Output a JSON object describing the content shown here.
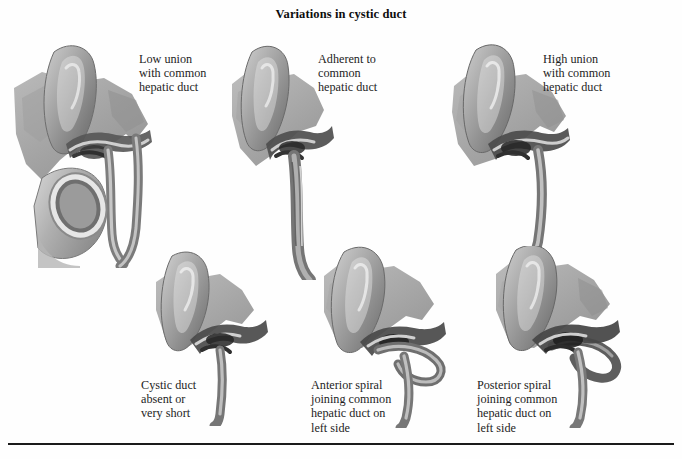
{
  "plate": {
    "title": "Variations in cystic duct",
    "background_color": "#fefefe",
    "text_color": "#1d1d1d",
    "rule_color": "#1a1a1a",
    "width": 682,
    "height": 459
  },
  "figures": [
    {
      "id": "low-union",
      "caption": "Low union\nwith common\nhepatic duct",
      "row": "top",
      "column": 1,
      "structures": [
        "liver",
        "gallbladder",
        "cystic duct",
        "common hepatic duct",
        "common bile duct",
        "duodenum"
      ]
    },
    {
      "id": "adherent-to-common-hepatic-duct",
      "caption": "Adherent to\ncommon\nhepatic duct",
      "row": "top",
      "column": 2,
      "structures": [
        "liver",
        "gallbladder",
        "cystic duct",
        "common hepatic duct",
        "common bile duct"
      ]
    },
    {
      "id": "high-union",
      "caption": "High union\nwith common\nhepatic duct",
      "row": "top",
      "column": 3,
      "structures": [
        "liver",
        "gallbladder",
        "cystic duct",
        "common hepatic duct",
        "common bile duct"
      ]
    },
    {
      "id": "cystic-duct-absent",
      "caption": "Cystic duct\nabsent or\nvery short",
      "row": "bottom",
      "column": 1,
      "structures": [
        "liver",
        "gallbladder",
        "common hepatic duct",
        "common bile duct"
      ]
    },
    {
      "id": "anterior-spiral",
      "caption": "Anterior spiral\njoining common\nhepatic duct on\nleft side",
      "row": "bottom",
      "column": 2,
      "structures": [
        "liver",
        "gallbladder",
        "cystic duct",
        "common hepatic duct",
        "common bile duct"
      ]
    },
    {
      "id": "posterior-spiral",
      "caption": "Posterior spiral\njoining common\nhepatic duct on\nleft side",
      "row": "bottom",
      "column": 3,
      "structures": [
        "liver",
        "gallbladder",
        "cystic duct",
        "common hepatic duct",
        "common bile duct"
      ]
    }
  ]
}
